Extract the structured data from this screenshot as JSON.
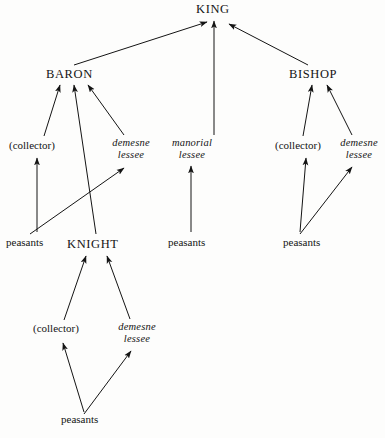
{
  "diagram": {
    "type": "hierarchy-diagram",
    "background_color": "#fdfdfc",
    "ink_color": "#141414",
    "nodes": {
      "king": {
        "label": "KING"
      },
      "baron": {
        "label": "BARON"
      },
      "bishop": {
        "label": "BISHOP"
      },
      "knight": {
        "label": "KNIGHT"
      },
      "baron_collector": {
        "label": "(collector)"
      },
      "baron_demesne_line1": {
        "label": "demesne"
      },
      "baron_demesne_line2": {
        "label": "lessee"
      },
      "manorial_line1": {
        "label": "manorial"
      },
      "manorial_line2": {
        "label": "lessee"
      },
      "bishop_collector": {
        "label": "(collector)"
      },
      "bishop_demesne_line1": {
        "label": "demesne"
      },
      "bishop_demesne_line2": {
        "label": "lessee"
      },
      "knight_collector": {
        "label": "(collector)"
      },
      "knight_demesne_line1": {
        "label": "demesne"
      },
      "knight_demesne_line2": {
        "label": "lessee"
      },
      "peasants_baron": {
        "label": "peasants"
      },
      "peasants_manorial": {
        "label": "peasants"
      },
      "peasants_bishop": {
        "label": "peasants"
      },
      "peasants_knight": {
        "label": "peasants"
      }
    },
    "edges": [
      {
        "from": "baron",
        "to": "king"
      },
      {
        "from": "manorial_lessee",
        "to": "king"
      },
      {
        "from": "bishop",
        "to": "king"
      },
      {
        "from": "baron_collector",
        "to": "baron"
      },
      {
        "from": "knight",
        "to": "baron"
      },
      {
        "from": "baron_demesne_lessee",
        "to": "baron"
      },
      {
        "from": "peasants_baron",
        "to": "baron_collector"
      },
      {
        "from": "peasants_baron",
        "to": "baron_demesne_lessee"
      },
      {
        "from": "peasants_manorial",
        "to": "manorial_lessee"
      },
      {
        "from": "bishop_collector",
        "to": "bishop"
      },
      {
        "from": "bishop_demesne_lessee",
        "to": "bishop"
      },
      {
        "from": "peasants_bishop",
        "to": "bishop_collector"
      },
      {
        "from": "peasants_bishop",
        "to": "bishop_demesne_lessee"
      },
      {
        "from": "knight_collector",
        "to": "knight"
      },
      {
        "from": "knight_demesne_lessee",
        "to": "knight"
      },
      {
        "from": "peasants_knight",
        "to": "knight_collector"
      },
      {
        "from": "peasants_knight",
        "to": "knight_demesne_lessee"
      }
    ]
  }
}
